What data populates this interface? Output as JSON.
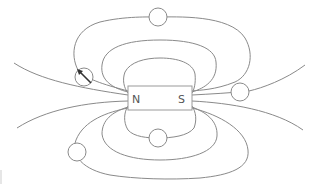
{
  "diagram": {
    "magnet": {
      "north_label": "N",
      "south_label": "S"
    },
    "compasses": [
      {
        "id": "top",
        "position": "above magnet on outer field loop",
        "needle_shown": false
      },
      {
        "id": "upper-left",
        "position": "left of magnet on outer upper field line",
        "needle_shown": true,
        "needle_direction": "pointing up-left (away from N pole)"
      },
      {
        "id": "right",
        "position": "right of magnet on field line near S pole",
        "needle_shown": false
      },
      {
        "id": "bottom",
        "position": "below magnet on inner lower loop",
        "needle_shown": false
      },
      {
        "id": "lower-left",
        "position": "lower left on outer lower field loop",
        "needle_shown": false
      }
    ],
    "colors": {
      "line": "#8a8a8a",
      "needle": "#333333",
      "label": "#555555",
      "background": "#ffffff"
    }
  }
}
